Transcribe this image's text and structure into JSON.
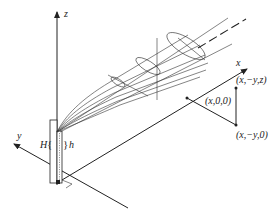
{
  "figure": {
    "type": "3D coordinate diagram of a vertical source/pipe emitting a spreading plume",
    "axes": {
      "x_label": "x",
      "y_label": "y",
      "z_label": "z"
    },
    "heights": {
      "stack_height_label": "H",
      "physical_height_label": "h"
    },
    "points": {
      "on_x_axis": "(x,0,0)",
      "ground_offset": "(x,−y,0)",
      "elevated": "(x,−y,z)"
    },
    "colors": {
      "ink": "#222222",
      "background": "#ffffff"
    }
  }
}
